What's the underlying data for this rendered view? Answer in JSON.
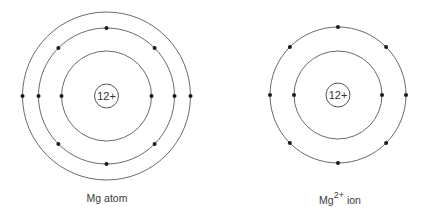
{
  "diagrams": [
    {
      "id": "atom",
      "caption": "Mg atom",
      "caption_base": "Mg",
      "caption_sup": "",
      "caption_rest": " atom",
      "center": [
        106.5,
        96
      ],
      "nucleus": {
        "label": "12+",
        "charge": 12,
        "radius": 12
      },
      "shells": [
        {
          "radius": 45,
          "electrons": 2
        },
        {
          "radius": 68,
          "electrons": 8
        },
        {
          "radius": 84,
          "electrons": 2
        }
      ]
    },
    {
      "id": "ion",
      "caption": "Mg2+ ion",
      "caption_base": "Mg",
      "caption_sup": "2+",
      "caption_rest": " ion",
      "center": [
        338,
        95
      ],
      "nucleus": {
        "label": "12+",
        "charge": 12,
        "radius": 12
      },
      "shells": [
        {
          "radius": 44,
          "electrons": 2
        },
        {
          "radius": 68,
          "electrons": 8
        }
      ]
    }
  ],
  "colors": {
    "shell": "#6a6a6a",
    "electron": "#1a1a1a",
    "text": "#3a3a3a"
  }
}
